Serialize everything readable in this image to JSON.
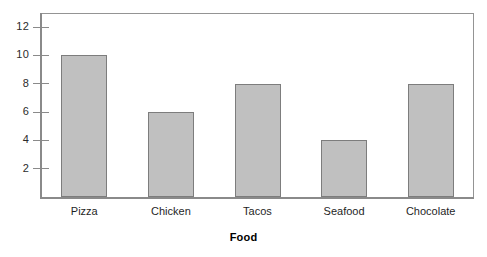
{
  "chart_data": {
    "type": "bar",
    "title": "",
    "subtitle": "",
    "xlabel": "Food",
    "ylabel": "",
    "categories": [
      "Pizza",
      "Chicken",
      "Tacos",
      "Seafood",
      "Chocolate"
    ],
    "values": [
      10,
      6,
      8,
      4,
      8
    ],
    "ylim": [
      0,
      13
    ],
    "yticks": [
      2,
      4,
      6,
      8,
      10,
      12
    ],
    "ytick_labels": [
      "2",
      "4",
      "6",
      "8",
      "10",
      "12"
    ],
    "grid": false,
    "legend": false,
    "legend_position": "none",
    "orientation": "vertical",
    "annotations": []
  },
  "style": {
    "bar_fill": "#c0c0c0",
    "bar_stroke": "#7d7d7d",
    "axis_color": "#8a8a8a",
    "frame_color": "#949494",
    "text_color": "#1f1f1f",
    "background": "#ffffff"
  },
  "axis_title": {
    "x": "Food"
  }
}
